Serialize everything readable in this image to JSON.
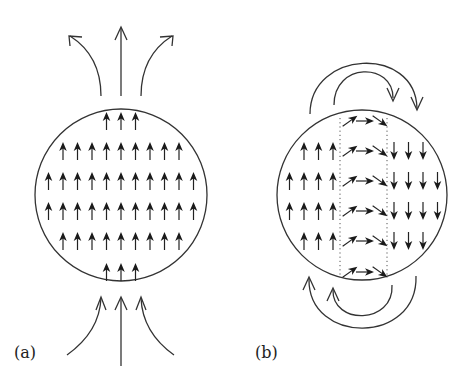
{
  "figure": {
    "panels": [
      {
        "id": "a",
        "label": "(a)",
        "description": "Uniformly magnetized sphere: all domains point up; external field lines enter at bottom and exit at top",
        "circle": {
          "cx": 121,
          "cy": 195,
          "r": 86
        },
        "rows": [
          {
            "y": 121,
            "count": 3,
            "direction": "up"
          },
          {
            "y": 151,
            "count": 9,
            "direction": "up"
          },
          {
            "y": 181,
            "count": 11,
            "direction": "up"
          },
          {
            "y": 211,
            "count": 11,
            "direction": "up"
          },
          {
            "y": 241,
            "count": 9,
            "direction": "up"
          },
          {
            "y": 272,
            "count": 3,
            "direction": "up"
          }
        ],
        "external_field": "field lines exit upward (3 arrows) and enter from below (3 arrows)"
      },
      {
        "id": "b",
        "label": "(b)",
        "description": "Two-domain sphere with domain wall: left domain up, right domain down, rotating moments across the wall; flux closes via loops above and below",
        "circle": {
          "cx": 362,
          "cy": 195,
          "r": 85
        },
        "domain_wall": {
          "x_left": 340,
          "x_right": 387
        },
        "rows": [
          {
            "y": 121,
            "up": 0,
            "wall": 3,
            "down": 0
          },
          {
            "y": 151,
            "up": 3,
            "wall": 3,
            "down": 3
          },
          {
            "y": 181,
            "up": 4,
            "wall": 3,
            "down": 4
          },
          {
            "y": 211,
            "up": 4,
            "wall": 3,
            "down": 4
          },
          {
            "y": 241,
            "up": 3,
            "wall": 3,
            "down": 3
          },
          {
            "y": 272,
            "up": 0,
            "wall": 3,
            "down": 0
          }
        ],
        "wall_arrows": [
          "up-right",
          "right",
          "down-right"
        ],
        "external_field": "two clockwise closure loops above, two counter-clockwise closure loops below"
      }
    ]
  }
}
